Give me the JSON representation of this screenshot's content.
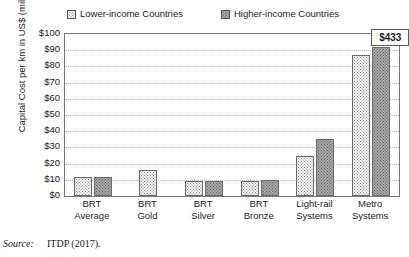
{
  "chart_data": {
    "type": "bar",
    "title": "",
    "xlabel": "",
    "ylabel": "Capital Cost per km in US$ (millions)",
    "ylim": [
      0,
      100
    ],
    "ytick_labels": [
      "$100",
      "$90",
      "$80",
      "$70",
      "$60",
      "$50",
      "$40",
      "$30",
      "$20",
      "$10",
      "$0"
    ],
    "ytick_values": [
      100,
      90,
      80,
      70,
      60,
      50,
      40,
      30,
      20,
      10,
      0
    ],
    "grid": true,
    "legend_position": "top",
    "categories": [
      "BRT Average",
      "BRT Gold",
      "BRT Silver",
      "BRT Bronze",
      "Light-rail Systems",
      "Metro Systems"
    ],
    "category_lines": [
      [
        "BRT",
        "Average"
      ],
      [
        "BRT",
        "Gold"
      ],
      [
        "BRT",
        "Silver"
      ],
      [
        "BRT",
        "Bronze"
      ],
      [
        "Light-rail",
        "Systems"
      ],
      [
        "Metro",
        "Systems"
      ]
    ],
    "series": [
      {
        "name": "Lower-income Countries",
        "swatch": "lower",
        "values": [
          12,
          16,
          9.5,
          9.5,
          25,
          87
        ]
      },
      {
        "name": "Higher-income Countries",
        "swatch": "higher",
        "values": [
          12,
          null,
          9.5,
          10,
          35,
          92
        ]
      }
    ],
    "annotations": [
      {
        "label": "$433",
        "note": "Metro Systems, Higher-income Countries actual value (bar clipped at axis maximum)",
        "series": "Higher-income Countries",
        "category": "Metro Systems",
        "value": 433
      }
    ]
  },
  "legend": {
    "items": [
      {
        "label": "Lower-income Countries",
        "swatch": "lower"
      },
      {
        "label": "Higher-income Countries",
        "swatch": "higher"
      }
    ]
  },
  "source": {
    "label": "Source:",
    "text": "ITDP (2017)."
  },
  "colors": {
    "lower_fill": "#f4f4f4",
    "higher_fill": "#a5a5a5",
    "bar_outline": "#6b6b6b",
    "axis": "#7a7a7a",
    "grid": "#b4b4b4",
    "text": "#1a1a1a"
  }
}
